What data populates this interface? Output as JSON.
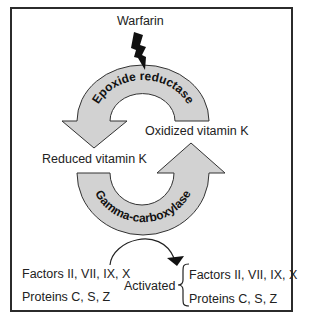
{
  "diagram": {
    "inhibitor": {
      "label": "Warfarin",
      "icon": "lightning-bolt-icon"
    },
    "enzymes": {
      "top": "Epoxide reductase",
      "bottom": "Gamma-carboxylase"
    },
    "states": {
      "oxidized": "Oxidized vitamin K",
      "reduced": "Reduced vitamin K"
    },
    "inputs": {
      "factors": "Factors II, VII, IX, X",
      "proteins": "Proteins C, S, Z"
    },
    "outputs": {
      "activated_label": "Activated",
      "factors": "Factors II, VII, IX, X",
      "proteins": "Proteins C, S, Z"
    },
    "colors": {
      "arrow_fill": "#d2d2d2",
      "arrow_stroke": "#333333",
      "frame": "#2b2b2b",
      "text": "#222222"
    }
  }
}
